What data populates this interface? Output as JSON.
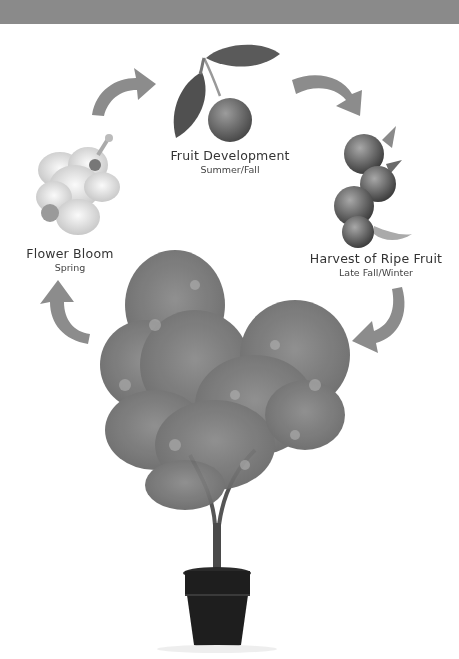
{
  "header": {
    "color": "#8a8a8a"
  },
  "diagram": {
    "stages": [
      {
        "name": "Flower Bloom",
        "season": "Spring",
        "icon": "flower-icon"
      },
      {
        "name": "Fruit Development",
        "season": "Summer/Fall",
        "icon": "fruit-branch-icon"
      },
      {
        "name": "Harvest of Ripe Fruit",
        "season": "Late Fall/Winter",
        "icon": "ripe-fruit-cluster-icon"
      }
    ],
    "arrows": [
      {
        "from": "Flower Bloom",
        "to": "Fruit Development",
        "icon": "curved-arrow-icon"
      },
      {
        "from": "Fruit Development",
        "to": "Harvest of Ripe Fruit",
        "icon": "curved-arrow-icon"
      },
      {
        "from": "Harvest of Ripe Fruit",
        "to": "Tree",
        "icon": "curved-arrow-icon"
      },
      {
        "from": "Tree",
        "to": "Flower Bloom",
        "icon": "curved-arrow-icon"
      }
    ],
    "center": {
      "name": "Potted fruit tree",
      "icon": "potted-tree-icon"
    },
    "colors": {
      "arrow": "#8c8c8c",
      "text": "#333333",
      "pot": "#1e1e1e",
      "foliage": "#7a7a7a"
    }
  }
}
